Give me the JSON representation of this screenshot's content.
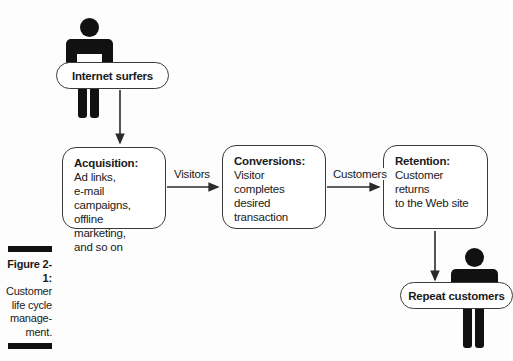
{
  "figure": {
    "caption_label": "Figure 2-1:",
    "caption_lines": [
      "Customer",
      "life cycle",
      "manage-",
      "ment."
    ]
  },
  "nodes": {
    "internet_surfers": {
      "label": "Internet surfers",
      "shape": "pill"
    },
    "repeat_customers": {
      "label": "Repeat customers",
      "shape": "pill"
    },
    "acquisition": {
      "title": "Acquisition:",
      "lines": [
        "Ad links,",
        "e-mail campaigns,",
        "offline marketing,",
        "and so on"
      ]
    },
    "conversions": {
      "title": "Conversions:",
      "lines": [
        "Visitor completes",
        "desired transaction"
      ]
    },
    "retention": {
      "title": "Retention:",
      "lines": [
        "Customer returns",
        "to the Web site"
      ]
    }
  },
  "edges": {
    "surfers_to_acquisition": {
      "label": ""
    },
    "acquisition_to_conversions": {
      "label": "Visitors"
    },
    "conversions_to_retention": {
      "label": "Customers"
    },
    "retention_to_repeat": {
      "label": ""
    }
  },
  "icons": {
    "person_surfers": "person-icon",
    "person_repeat": "person-icon"
  },
  "colors": {
    "background": "#fdfdfd",
    "stroke": "#3a3a3a",
    "figure_black": "#111111",
    "text": "#1a1a1a"
  }
}
